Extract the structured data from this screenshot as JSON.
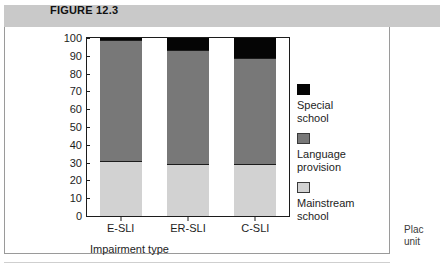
{
  "header": {
    "label": "FIGURE 12.3"
  },
  "side_caption": "Plac\nunit",
  "chart_data": {
    "type": "bar",
    "subtype": "stacked-bar-100",
    "title": "",
    "xlabel": "Impairment type",
    "ylabel": "",
    "categories": [
      "E-SLI",
      "ER-SLI",
      "C-SLI"
    ],
    "series": [
      {
        "name": "Mainstream school",
        "color": "#d2d2d2",
        "values": [
          31,
          29,
          29
        ]
      },
      {
        "name": "Language provision",
        "color": "#787878",
        "values": [
          68,
          64,
          60
        ]
      },
      {
        "name": "Special school",
        "color": "#050505",
        "values": [
          1,
          7,
          11
        ]
      }
    ],
    "ylim": [
      0,
      100
    ],
    "yticks": [
      100,
      90,
      80,
      70,
      60,
      50,
      40,
      30,
      20,
      10,
      0
    ],
    "ytick_labels": [
      "100",
      "90",
      "80",
      "70",
      "60",
      "50",
      "40",
      "30",
      "20",
      "10",
      "0"
    ],
    "grid": false,
    "legend_position": "right",
    "legend": [
      {
        "label": "Special school",
        "color": "#050505"
      },
      {
        "label": "Language provision",
        "color": "#787878"
      },
      {
        "label": "Mainstream school",
        "color": "#d2d2d2"
      }
    ]
  }
}
